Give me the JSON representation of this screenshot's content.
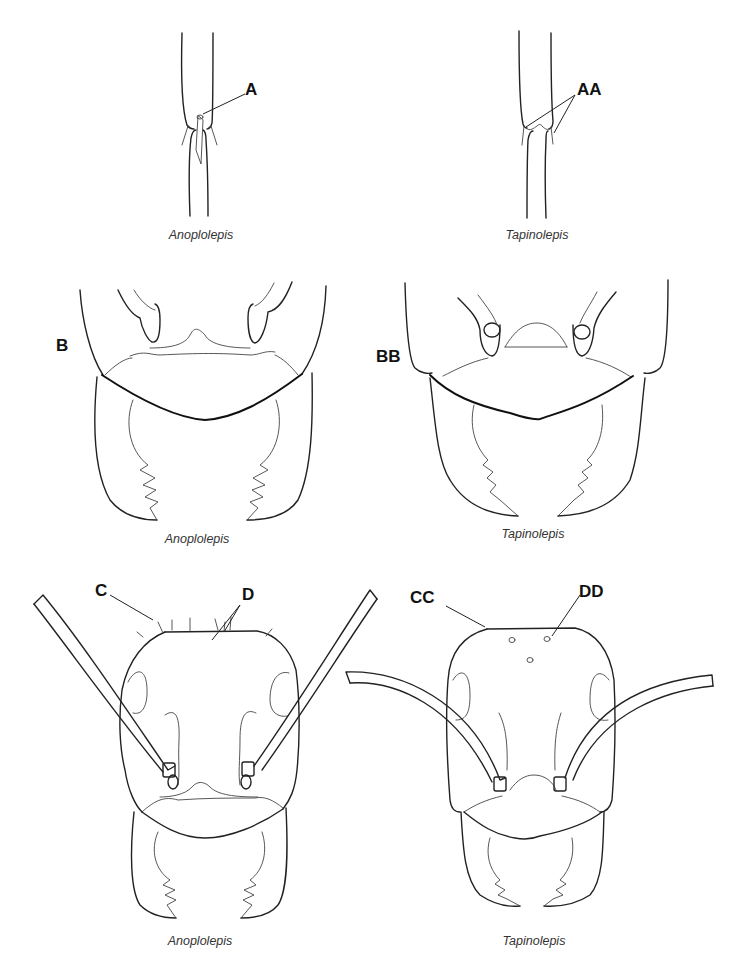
{
  "figure": {
    "type": "taxonomic-comparison-diagram",
    "panels": [
      {
        "id": "row1-left",
        "view": "petiole / gaster junction",
        "genus": "Anoplolepis",
        "labels": [
          "A"
        ]
      },
      {
        "id": "row1-right",
        "view": "petiole / gaster junction",
        "genus": "Tapinolepis",
        "labels": [
          "AA"
        ]
      },
      {
        "id": "row2-left",
        "view": "clypeus and mandibles",
        "genus": "Anoplolepis",
        "labels": [
          "B"
        ]
      },
      {
        "id": "row2-right",
        "view": "clypeus and mandibles",
        "genus": "Tapinolepis",
        "labels": [
          "BB"
        ]
      },
      {
        "id": "row3-left",
        "view": "full head, frontal",
        "genus": "Anoplolepis",
        "labels": [
          "C",
          "D"
        ]
      },
      {
        "id": "row3-right",
        "view": "full head, frontal",
        "genus": "Tapinolepis",
        "labels": [
          "CC",
          "DD"
        ]
      }
    ]
  },
  "labels": {
    "A": "A",
    "AA": "AA",
    "B": "B",
    "BB": "BB",
    "C": "C",
    "D": "D",
    "CC": "CC",
    "DD": "DD"
  },
  "captions": {
    "row1_left": "Anoplolepis",
    "row1_right": "Tapinolepis",
    "row2_left": "Anoplolepis",
    "row2_right": "Tapinolepis",
    "row3_left": "Anoplolepis",
    "row3_right": "Tapinolepis"
  },
  "colors": {
    "line": "#222222",
    "background": "#ffffff",
    "caption": "#333333"
  }
}
